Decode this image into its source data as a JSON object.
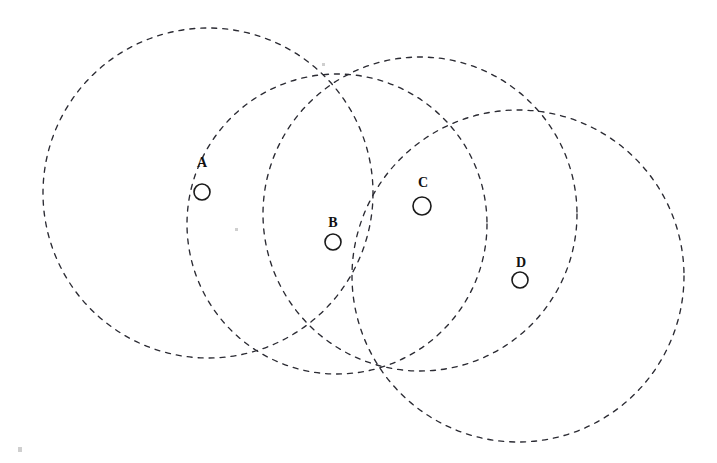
{
  "figure": {
    "background_color": "#ffffff",
    "stroke_color": "#2b2b33",
    "marker_stroke_color": "#1a1a1a",
    "label_color": "#111111",
    "width": 717,
    "height": 463
  },
  "chart_data": {
    "type": "scatter",
    "title": "",
    "xlabel": "",
    "ylabel": "",
    "grid": false,
    "legend": null,
    "axis_visible": false,
    "xlim": [
      0,
      717
    ],
    "ylim": [
      0,
      463
    ],
    "nodes": [
      {
        "label": "A",
        "x": 202,
        "y": 192,
        "marker_radius": 8,
        "label_x": 202,
        "label_y": 167
      },
      {
        "label": "B",
        "x": 333,
        "y": 242,
        "marker_radius": 8,
        "label_x": 333,
        "label_y": 227
      },
      {
        "label": "C",
        "x": 422,
        "y": 206,
        "marker_radius": 9,
        "label_x": 423,
        "label_y": 187
      },
      {
        "label": "D",
        "x": 520,
        "y": 280,
        "marker_radius": 8,
        "label_x": 521,
        "label_y": 267
      }
    ],
    "coverage_circles": [
      {
        "name": "circle-a",
        "cx": 208,
        "cy": 193,
        "r": 165,
        "dash": "5 6"
      },
      {
        "name": "circle-b",
        "cx": 337,
        "cy": 224,
        "r": 150,
        "dash": "5 6"
      },
      {
        "name": "circle-c",
        "cx": 420,
        "cy": 214,
        "r": 157,
        "dash": "5 6"
      },
      {
        "name": "circle-d",
        "cx": 518,
        "cy": 276,
        "r": 166,
        "dash": "5 6"
      }
    ],
    "specks": [
      {
        "x": 18,
        "y": 447,
        "w": 4,
        "h": 5
      },
      {
        "x": 235,
        "y": 228,
        "w": 3,
        "h": 3
      },
      {
        "x": 322,
        "y": 63,
        "w": 3,
        "h": 3
      }
    ]
  }
}
